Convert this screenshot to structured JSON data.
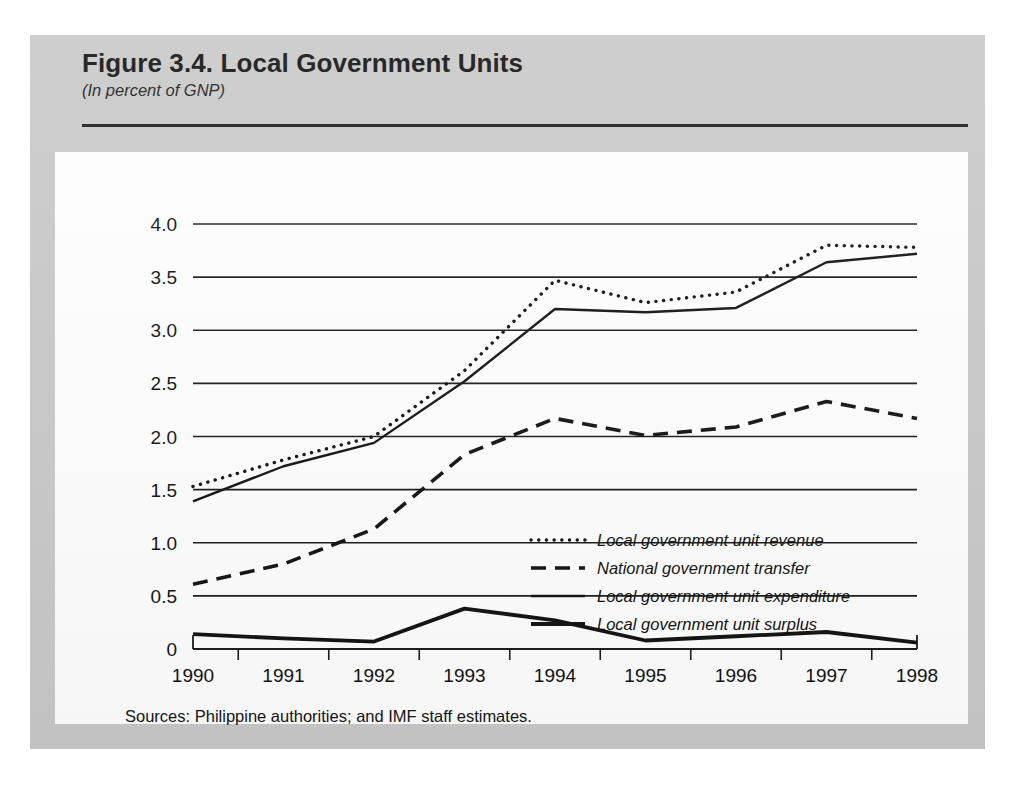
{
  "figure": {
    "title": "Figure 3.4.  Local Government Units",
    "subtitle": "(In percent of GNP)",
    "source_note": "Sources:  Philippine authorities; and IMF staff estimates.",
    "panel_color": "#c9c9c9",
    "card_color": "#ffffff",
    "ink_color": "#111111"
  },
  "chart_data": {
    "type": "line",
    "title": "Figure 3.4.  Local Government Units",
    "subtitle": "(In percent of GNP)",
    "xlabel": "",
    "ylabel": "",
    "x": [
      1990,
      1991,
      1992,
      1993,
      1994,
      1995,
      1996,
      1997,
      1998
    ],
    "xtick_labels": [
      "1990",
      "1991",
      "1992",
      "1993",
      "1994",
      "1995",
      "1996",
      "1997",
      "1998"
    ],
    "ytick_values": [
      0,
      0.5,
      1.0,
      1.5,
      2.0,
      2.5,
      3.0,
      3.5,
      4.0
    ],
    "ytick_labels": [
      "0",
      "0.5",
      "1.0",
      "1.5",
      "2.0",
      "2.5",
      "3.0",
      "3.5",
      "4.0"
    ],
    "ylim": [
      0,
      4.0
    ],
    "grid": true,
    "grid_axis": "y",
    "legend_position": "center-right-inside",
    "series": [
      {
        "name": "Local government unit revenue",
        "style": "dotted",
        "color": "#111111",
        "values": [
          1.53,
          1.78,
          2.0,
          2.62,
          3.47,
          3.26,
          3.36,
          3.8,
          3.78
        ]
      },
      {
        "name": "National government transfer",
        "style": "dashed",
        "color": "#111111",
        "values": [
          0.61,
          0.8,
          1.13,
          1.83,
          2.17,
          2.01,
          2.09,
          2.33,
          2.17
        ]
      },
      {
        "name": "Local government unit expenditure",
        "style": "solid-thin",
        "color": "#111111",
        "values": [
          1.39,
          1.72,
          1.94,
          2.52,
          3.2,
          3.17,
          3.21,
          3.64,
          3.72
        ]
      },
      {
        "name": "Local government unit surplus",
        "style": "solid-thick",
        "color": "#111111",
        "values": [
          0.14,
          0.1,
          0.07,
          0.38,
          0.27,
          0.08,
          0.12,
          0.16,
          0.06
        ]
      }
    ]
  }
}
